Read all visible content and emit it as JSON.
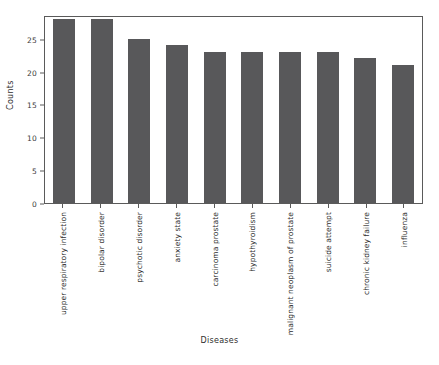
{
  "chart_data": {
    "type": "bar",
    "title": "",
    "xlabel": "Diseases",
    "ylabel": "Counts",
    "categories": [
      "upper respiratory infection",
      "bipolar disorder",
      "psychotic disorder",
      "anxiety state",
      "carcinoma prostate",
      "hypothyroidism",
      "malignant neoplasm of prostate",
      "suicide attempt",
      "chronic kidney failure",
      "influenza"
    ],
    "values": [
      28,
      28,
      25,
      24,
      23,
      23,
      23,
      23,
      22,
      21
    ],
    "ylim": [
      0,
      28.6
    ],
    "yticks": [
      0,
      5,
      10,
      15,
      20,
      25
    ],
    "ytick_labels": [
      "0",
      "5",
      "10",
      "15",
      "20",
      "25"
    ],
    "grid": false,
    "legend": null,
    "bar_color": "#58585a",
    "axis_color": "#5a5a5a",
    "background": "#ffffff"
  }
}
